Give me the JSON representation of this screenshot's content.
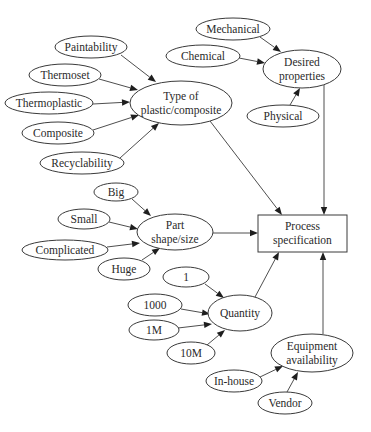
{
  "diagram": {
    "type": "influence-diagram",
    "nodes": [
      {
        "id": "paintability",
        "label": [
          "Paintability"
        ],
        "shape": "ellipse",
        "cx": 91,
        "cy": 47,
        "rx": 36,
        "ry": 11
      },
      {
        "id": "thermoset",
        "label": [
          "Thermoset"
        ],
        "shape": "ellipse",
        "cx": 65,
        "cy": 75,
        "rx": 36,
        "ry": 11
      },
      {
        "id": "thermoplastic",
        "label": [
          "Thermoplastic"
        ],
        "shape": "ellipse",
        "cx": 49,
        "cy": 103,
        "rx": 44,
        "ry": 11
      },
      {
        "id": "composite",
        "label": [
          "Composite"
        ],
        "shape": "ellipse",
        "cx": 58,
        "cy": 133,
        "rx": 36,
        "ry": 11
      },
      {
        "id": "recyclability",
        "label": [
          "Recyclability"
        ],
        "shape": "ellipse",
        "cx": 82,
        "cy": 163,
        "rx": 42,
        "ry": 11
      },
      {
        "id": "type",
        "label": [
          "Type of",
          "plastic/composite"
        ],
        "shape": "ellipse",
        "cx": 181,
        "cy": 103,
        "rx": 51,
        "ry": 22
      },
      {
        "id": "mechanical",
        "label": [
          "Mechanical"
        ],
        "shape": "ellipse",
        "cx": 233,
        "cy": 29,
        "rx": 37,
        "ry": 11
      },
      {
        "id": "chemical",
        "label": [
          "Chemical"
        ],
        "shape": "ellipse",
        "cx": 203,
        "cy": 56,
        "rx": 37,
        "ry": 11
      },
      {
        "id": "desired",
        "label": [
          "Desired",
          "properties"
        ],
        "shape": "ellipse",
        "cx": 302,
        "cy": 69,
        "rx": 39,
        "ry": 19
      },
      {
        "id": "physical",
        "label": [
          "Physical"
        ],
        "shape": "ellipse",
        "cx": 283,
        "cy": 116,
        "rx": 36,
        "ry": 11
      },
      {
        "id": "big",
        "label": [
          "Big"
        ],
        "shape": "ellipse",
        "cx": 116,
        "cy": 192,
        "rx": 22,
        "ry": 9
      },
      {
        "id": "small",
        "label": [
          "Small"
        ],
        "shape": "ellipse",
        "cx": 84,
        "cy": 219,
        "rx": 26,
        "ry": 10
      },
      {
        "id": "complicated",
        "label": [
          "Complicated"
        ],
        "shape": "ellipse",
        "cx": 65,
        "cy": 250,
        "rx": 43,
        "ry": 10
      },
      {
        "id": "huge",
        "label": [
          "Huge"
        ],
        "shape": "ellipse",
        "cx": 124,
        "cy": 269,
        "rx": 26,
        "ry": 11
      },
      {
        "id": "part",
        "label": [
          "Part",
          "shape/size"
        ],
        "shape": "ellipse",
        "cx": 175,
        "cy": 232,
        "rx": 38,
        "ry": 18
      },
      {
        "id": "process",
        "label": [
          "Process",
          "specification"
        ],
        "shape": "rect",
        "x": 258,
        "y": 215,
        "w": 89,
        "h": 37
      },
      {
        "id": "q1",
        "label": [
          "1"
        ],
        "shape": "ellipse",
        "cx": 186,
        "cy": 277,
        "rx": 23,
        "ry": 10
      },
      {
        "id": "q1000",
        "label": [
          "1000"
        ],
        "shape": "ellipse",
        "cx": 155,
        "cy": 305,
        "rx": 27,
        "ry": 11
      },
      {
        "id": "q1m",
        "label": [
          "1M"
        ],
        "shape": "ellipse",
        "cx": 154,
        "cy": 330,
        "rx": 25,
        "ry": 10
      },
      {
        "id": "q10m",
        "label": [
          "10M"
        ],
        "shape": "ellipse",
        "cx": 191,
        "cy": 353,
        "rx": 24,
        "ry": 11
      },
      {
        "id": "quantity",
        "label": [
          "Quantity"
        ],
        "shape": "ellipse",
        "cx": 240,
        "cy": 313,
        "rx": 32,
        "ry": 18
      },
      {
        "id": "equipment",
        "label": [
          "Equipment",
          "availability"
        ],
        "shape": "ellipse",
        "cx": 312,
        "cy": 353,
        "rx": 41,
        "ry": 19
      },
      {
        "id": "inhouse",
        "label": [
          "In-house"
        ],
        "shape": "ellipse",
        "cx": 234,
        "cy": 381,
        "rx": 28,
        "ry": 11
      },
      {
        "id": "vendor",
        "label": [
          "Vendor"
        ],
        "shape": "ellipse",
        "cx": 285,
        "cy": 403,
        "rx": 27,
        "ry": 11
      }
    ],
    "edges": [
      {
        "from": "paintability",
        "to": "type",
        "x1": 121,
        "y1": 55,
        "x2": 156,
        "y2": 82
      },
      {
        "from": "thermoset",
        "to": "type",
        "x1": 99,
        "y1": 79,
        "x2": 138,
        "y2": 90
      },
      {
        "from": "thermoplastic",
        "to": "type",
        "x1": 93,
        "y1": 104,
        "x2": 130,
        "y2": 102
      },
      {
        "from": "composite",
        "to": "type",
        "x1": 93,
        "y1": 130,
        "x2": 139,
        "y2": 115
      },
      {
        "from": "recyclability",
        "to": "type",
        "x1": 120,
        "y1": 158,
        "x2": 159,
        "y2": 123
      },
      {
        "from": "mechanical",
        "to": "desired",
        "x1": 260,
        "y1": 37,
        "x2": 281,
        "y2": 52
      },
      {
        "from": "chemical",
        "to": "desired",
        "x1": 239,
        "y1": 58,
        "x2": 265,
        "y2": 63
      },
      {
        "from": "physical",
        "to": "desired",
        "x1": 290,
        "y1": 105,
        "x2": 300,
        "y2": 88
      },
      {
        "from": "type",
        "to": "process",
        "x1": 210,
        "y1": 121,
        "x2": 282,
        "y2": 215
      },
      {
        "from": "desired",
        "to": "process",
        "x1": 324,
        "y1": 85,
        "x2": 324,
        "y2": 215
      },
      {
        "from": "big",
        "to": "part",
        "x1": 132,
        "y1": 199,
        "x2": 151,
        "y2": 216
      },
      {
        "from": "small",
        "to": "part",
        "x1": 109,
        "y1": 222,
        "x2": 138,
        "y2": 229
      },
      {
        "from": "complicated",
        "to": "part",
        "x1": 107,
        "y1": 247,
        "x2": 140,
        "y2": 243
      },
      {
        "from": "huge",
        "to": "part",
        "x1": 142,
        "y1": 260,
        "x2": 160,
        "y2": 248
      },
      {
        "from": "part",
        "to": "process",
        "x1": 213,
        "y1": 233,
        "x2": 258,
        "y2": 233
      },
      {
        "from": "q1",
        "to": "quantity",
        "x1": 205,
        "y1": 284,
        "x2": 224,
        "y2": 298
      },
      {
        "from": "q1000",
        "to": "quantity",
        "x1": 181,
        "y1": 309,
        "x2": 210,
        "y2": 314
      },
      {
        "from": "q1m",
        "to": "quantity",
        "x1": 178,
        "y1": 328,
        "x2": 212,
        "y2": 324
      },
      {
        "from": "q10m",
        "to": "quantity",
        "x1": 207,
        "y1": 345,
        "x2": 225,
        "y2": 330
      },
      {
        "from": "quantity",
        "to": "process",
        "x1": 255,
        "y1": 297,
        "x2": 279,
        "y2": 252
      },
      {
        "from": "equipment",
        "to": "process",
        "x1": 323,
        "y1": 334,
        "x2": 323,
        "y2": 252
      },
      {
        "from": "inhouse",
        "to": "equipment",
        "x1": 260,
        "y1": 377,
        "x2": 283,
        "y2": 366
      },
      {
        "from": "vendor",
        "to": "equipment",
        "x1": 287,
        "y1": 392,
        "x2": 298,
        "y2": 372
      }
    ]
  }
}
